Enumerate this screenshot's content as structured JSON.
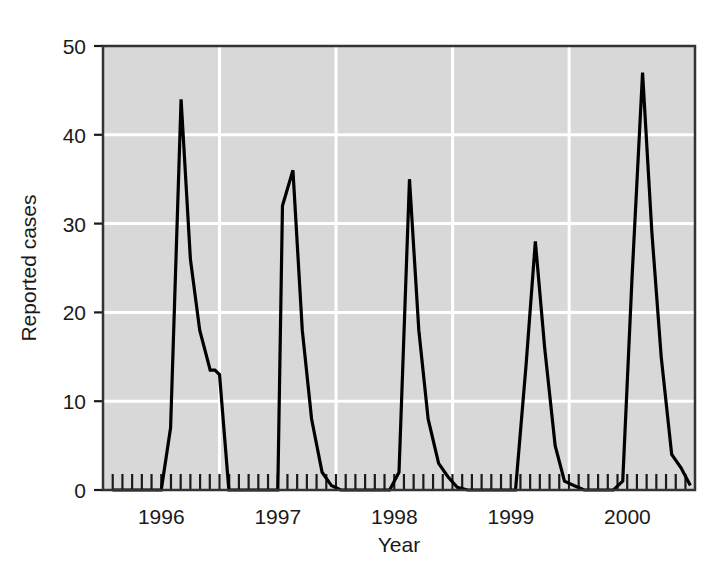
{
  "chart_data": {
    "type": "line",
    "title": "",
    "xlabel": "Year",
    "ylabel": "Reported cases",
    "xlim": [
      1995.5,
      2000.58
    ],
    "ylim": [
      0,
      50
    ],
    "grid": true,
    "grid_color": "#ffffff",
    "plot_background": "#d8d8d8",
    "line_color": "#000000",
    "legend": "none",
    "x_tick_labels": [
      "1996",
      "1997",
      "1998",
      "1999",
      "2000"
    ],
    "x_tick_values": [
      1996,
      1997,
      1998,
      1999,
      2000
    ],
    "x_minor_tick_interval_years": 0.0833,
    "y_tick_labels": [
      "0",
      "10",
      "20",
      "30",
      "40",
      "50"
    ],
    "y_tick_values": [
      0,
      10,
      20,
      30,
      40,
      50
    ],
    "y_gridline_values": [
      10,
      20,
      30,
      40
    ],
    "x_gridline_values": [
      1996.5,
      1997.5,
      1998.5,
      1999.5
    ],
    "series": [
      {
        "name": "Reported cases",
        "x": [
          1995.58,
          1995.67,
          1995.75,
          1995.83,
          1995.92,
          1996.0,
          1996.08,
          1996.17,
          1996.25,
          1996.33,
          1996.42,
          1996.46,
          1996.5,
          1996.58,
          1996.67,
          1996.75,
          1996.83,
          1996.92,
          1997.0,
          1997.04,
          1997.13,
          1997.21,
          1997.29,
          1997.38,
          1997.46,
          1997.54,
          1997.63,
          1997.71,
          1997.79,
          1997.88,
          1997.96,
          1998.04,
          1998.13,
          1998.21,
          1998.29,
          1998.38,
          1998.46,
          1998.54,
          1998.63,
          1998.71,
          1998.79,
          1998.88,
          1998.96,
          1999.04,
          1999.13,
          1999.21,
          1999.29,
          1999.38,
          1999.46,
          1999.54,
          1999.63,
          1999.71,
          1999.79,
          1999.88,
          1999.96,
          2000.04,
          2000.13,
          2000.21,
          2000.29,
          2000.38,
          2000.46,
          2000.54
        ],
        "y": [
          0,
          0,
          0,
          0,
          0,
          0,
          7,
          44,
          26,
          18,
          13.5,
          13.5,
          13,
          0,
          0,
          0,
          0,
          0,
          0,
          32,
          36,
          18,
          8,
          2,
          0.5,
          0,
          0,
          0,
          0,
          0,
          0,
          2,
          35,
          18,
          8,
          3,
          1.5,
          0.3,
          0,
          0,
          0,
          0,
          0,
          0,
          14,
          28,
          16,
          5,
          1,
          0.5,
          0,
          0,
          0,
          0,
          1,
          24,
          47,
          29,
          15,
          4,
          2.5,
          0.5
        ]
      }
    ],
    "peaks": [
      {
        "year_label": "1996",
        "peak_value": 44
      },
      {
        "year_label": "1997",
        "peak_value": 36,
        "shoulder_value": 32
      },
      {
        "year_label": "1998",
        "peak_value": 35
      },
      {
        "year_label": "1999",
        "peak_value": 28
      },
      {
        "year_label": "2000",
        "peak_value": 47
      }
    ]
  }
}
